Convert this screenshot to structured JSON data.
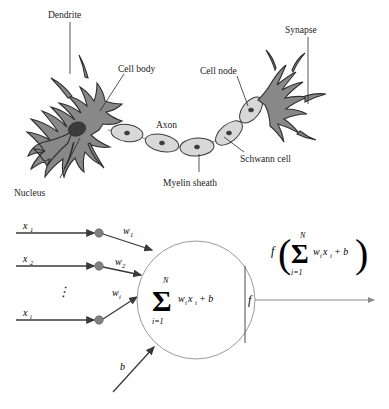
{
  "figure": {
    "background_color": "#ffffff"
  },
  "biological_neuron": {
    "name": "biological-neuron-diagram",
    "colors": {
      "soma": "#888888",
      "soma_outline": "#2f2f2f",
      "myelin": "#d8d8d8",
      "nucleus": "#3b3b3b",
      "leader_line": "#2b2b2b"
    },
    "labels": [
      {
        "id": "dendrite",
        "text": "Dendrite"
      },
      {
        "id": "cell-body",
        "text": "Cell body"
      },
      {
        "id": "cell-node",
        "text": "Cell node"
      },
      {
        "id": "synapse",
        "text": "Synapse"
      },
      {
        "id": "axon",
        "text": "Axon"
      },
      {
        "id": "schwann-cell",
        "text": "Schwann cell"
      },
      {
        "id": "myelin-sheath",
        "text": "Myelin sheath"
      },
      {
        "id": "nucleus",
        "text": "Nucleus"
      }
    ]
  },
  "artificial_neuron": {
    "name": "artificial-neuron-model",
    "colors": {
      "arrow": "#3a3a3a",
      "node_dot": "#808080",
      "body_outline": "#9a9a9a",
      "output_line": "#8a8a8a"
    },
    "inputs": [
      {
        "var": "x",
        "sub": "1"
      },
      {
        "var": "x",
        "sub": "2"
      },
      {
        "var": "x",
        "sub": "i"
      }
    ],
    "weights": [
      {
        "var": "w",
        "sub": "1"
      },
      {
        "var": "w",
        "sub": "2"
      },
      {
        "var": "w",
        "sub": "i"
      }
    ],
    "vertical_dots": "⋮",
    "bias": {
      "var": "b"
    },
    "summation": {
      "sigma": "Σ",
      "upper_limit": "N",
      "lower_limit": "i=1",
      "lower_limit_var": "i",
      "lower_limit_value": "1",
      "body_w": "w",
      "body_w_sub": "i",
      "body_x": "x",
      "body_x_sub": "i",
      "plus_bias": "+ b"
    },
    "activation": {
      "label": "f"
    },
    "output": {
      "f": "f",
      "open_paren": "(",
      "close_paren": ")",
      "sigma": "Σ",
      "upper_limit": "N",
      "lower_limit": "i=1",
      "body_w": "w",
      "body_w_sub": "i",
      "body_x": "x",
      "body_x_sub": "i",
      "plus_bias": "+ b"
    }
  }
}
